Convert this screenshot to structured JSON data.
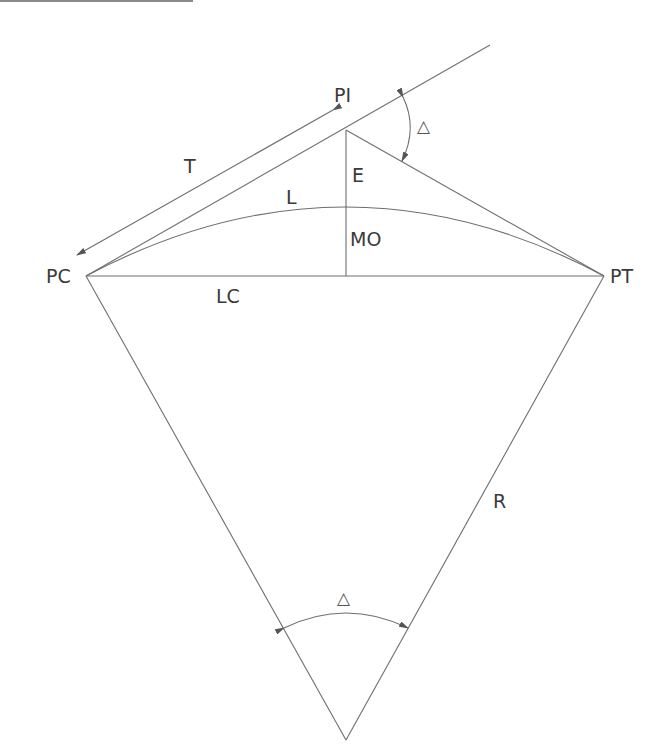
{
  "diagram": {
    "labels": {
      "pi": "PI",
      "pc": "PC",
      "pt": "PT",
      "tangent": "T",
      "external": "E",
      "length": "L",
      "middle_ordinate": "MO",
      "long_chord": "LC",
      "radius": "R",
      "delta_top": "△",
      "delta_bottom": "△"
    },
    "points": {
      "PI": [
        346,
        130
      ],
      "PC": [
        86,
        276
      ],
      "PT": [
        604,
        276
      ],
      "center": [
        346,
        740
      ],
      "arc_mid": [
        346,
        207
      ]
    },
    "line_color": "#6e6e6e",
    "text_color": "#3a3a3a"
  }
}
